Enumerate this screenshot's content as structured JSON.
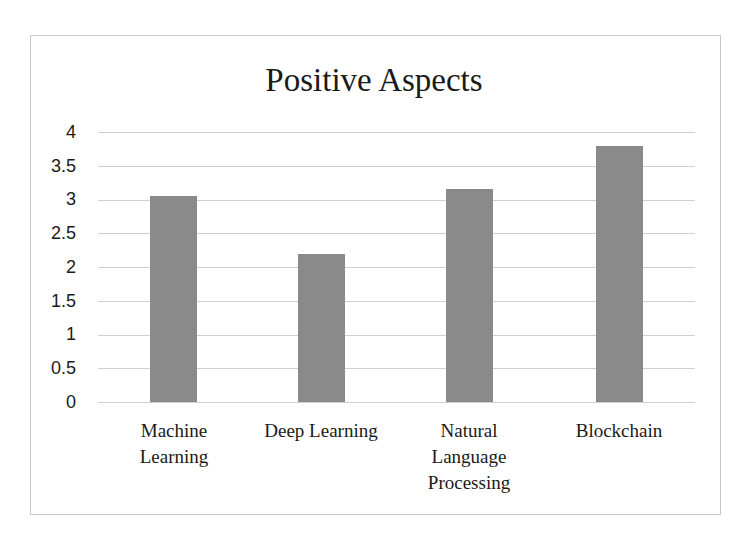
{
  "chart_data": {
    "type": "bar",
    "title": "Positive Aspects",
    "categories": [
      "Machine\nLearning",
      "Deep Learning",
      "Natural\nLanguage\nProcessing",
      "Blockchain"
    ],
    "values": [
      3.05,
      2.2,
      3.15,
      3.8
    ],
    "xlabel": "",
    "ylabel": "",
    "ylim": [
      0,
      4
    ],
    "yticks": [
      "0",
      "0.5",
      "1",
      "1.5",
      "2",
      "2.5",
      "3",
      "3.5",
      "4"
    ],
    "grid": true,
    "legend": "none",
    "bar_color": "#8a8a8a"
  }
}
